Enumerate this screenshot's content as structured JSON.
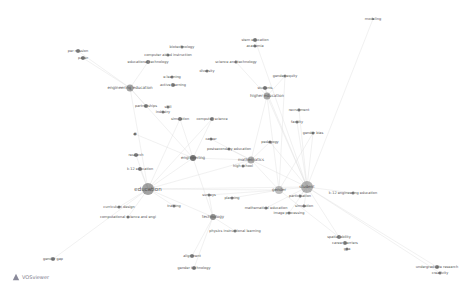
{
  "app": {
    "name": "VOSviewer"
  },
  "network": {
    "nodes": [
      {
        "label": "education",
        "x": 148,
        "y": 189,
        "r": 6,
        "fs": 5.5,
        "color": "#555"
      },
      {
        "label": "student",
        "x": 307,
        "y": 187,
        "r": 6,
        "fs": 4,
        "color": "#777"
      },
      {
        "label": "gender",
        "x": 279,
        "y": 190,
        "r": 4,
        "fs": 4,
        "color": "#888"
      },
      {
        "label": "engineering education",
        "x": 130,
        "y": 88,
        "r": 3.5,
        "fs": 4,
        "color": "#555"
      },
      {
        "label": "higher education",
        "x": 267,
        "y": 96,
        "r": 3.5,
        "fs": 4,
        "color": "#666"
      },
      {
        "label": "mathematics",
        "x": 251,
        "y": 160,
        "r": 3.5,
        "fs": 4,
        "color": "#666"
      },
      {
        "label": "engineering",
        "x": 193,
        "y": 158,
        "r": 3,
        "fs": 4,
        "color": "#555"
      },
      {
        "label": "technology",
        "x": 213,
        "y": 217,
        "r": 3,
        "fs": 4,
        "color": "#777"
      },
      {
        "label": "students",
        "x": 265,
        "y": 88,
        "r": 2,
        "fs": 3.5,
        "color": "#666"
      },
      {
        "label": "stem education",
        "x": 255,
        "y": 40,
        "r": 2,
        "fs": 3.5,
        "color": "#666"
      },
      {
        "label": "academia",
        "x": 255,
        "y": 46,
        "r": 1.5,
        "fs": 3.5,
        "color": "#666"
      },
      {
        "label": "science and technology",
        "x": 236,
        "y": 62,
        "r": 1.5,
        "fs": 3.5,
        "color": "#666"
      },
      {
        "label": "gender equity",
        "x": 285,
        "y": 76,
        "r": 1.5,
        "fs": 3.5,
        "color": "#666"
      },
      {
        "label": "recruitment",
        "x": 299,
        "y": 110,
        "r": 1.5,
        "fs": 3.5,
        "color": "#666"
      },
      {
        "label": "faculty",
        "x": 297,
        "y": 122,
        "r": 1.5,
        "fs": 3.5,
        "color": "#666"
      },
      {
        "label": "gender bias",
        "x": 313,
        "y": 133,
        "r": 1.5,
        "fs": 3.5,
        "color": "#666"
      },
      {
        "label": "pedagogy",
        "x": 270,
        "y": 142,
        "r": 1.5,
        "fs": 3.5,
        "color": "#666"
      },
      {
        "label": "postsecondary education",
        "x": 229,
        "y": 149,
        "r": 1.5,
        "fs": 3.5,
        "color": "#666"
      },
      {
        "label": "high school",
        "x": 243,
        "y": 166,
        "r": 1.5,
        "fs": 3.5,
        "color": "#666"
      },
      {
        "label": "career",
        "x": 211,
        "y": 139,
        "r": 1.5,
        "fs": 3.5,
        "color": "#666"
      },
      {
        "label": "computer science",
        "x": 212,
        "y": 119,
        "r": 2,
        "fs": 3.5,
        "color": "#666"
      },
      {
        "label": "simulation",
        "x": 180,
        "y": 119,
        "r": 2,
        "fs": 3.5,
        "color": "#666"
      },
      {
        "label": "partnerships",
        "x": 146,
        "y": 106,
        "r": 2,
        "fs": 3.5,
        "color": "#666"
      },
      {
        "label": "skill",
        "x": 168,
        "y": 107,
        "r": 1.5,
        "fs": 3.5,
        "color": "#666"
      },
      {
        "label": "industry",
        "x": 163,
        "y": 112,
        "r": 1.5,
        "fs": 3.5,
        "color": "#666"
      },
      {
        "label": "diversity",
        "x": 207,
        "y": 71,
        "r": 1.5,
        "fs": 3.5,
        "color": "#666"
      },
      {
        "label": "biotechnology",
        "x": 182,
        "y": 47,
        "r": 1.5,
        "fs": 3.5,
        "color": "#666"
      },
      {
        "label": "computer aided instruction",
        "x": 168,
        "y": 55,
        "r": 1.5,
        "fs": 3.5,
        "color": "#666"
      },
      {
        "label": "educational technology",
        "x": 148,
        "y": 62,
        "r": 2,
        "fs": 3.5,
        "color": "#666"
      },
      {
        "label": "e-learning",
        "x": 172,
        "y": 77,
        "r": 1.5,
        "fs": 3.5,
        "color": "#666"
      },
      {
        "label": "active learning",
        "x": 173,
        "y": 85,
        "r": 2,
        "fs": 3.5,
        "color": "#666"
      },
      {
        "label": "per mission",
        "x": 78,
        "y": 51,
        "r": 2,
        "fs": 3.5,
        "color": "#666"
      },
      {
        "label": "paper",
        "x": 83,
        "y": 58,
        "r": 2,
        "fs": 3.5,
        "color": "#666"
      },
      {
        "label": "ai",
        "x": 135,
        "y": 134,
        "r": 1.5,
        "fs": 3.5,
        "color": "#666"
      },
      {
        "label": "research",
        "x": 136,
        "y": 155,
        "r": 2,
        "fs": 3.5,
        "color": "#666"
      },
      {
        "label": "k-12 education",
        "x": 140,
        "y": 169,
        "r": 2,
        "fs": 3.5,
        "color": "#666"
      },
      {
        "label": "curriculum design",
        "x": 119,
        "y": 207,
        "r": 1.5,
        "fs": 3.5,
        "color": "#666"
      },
      {
        "label": "computational science and engi",
        "x": 128,
        "y": 217,
        "r": 1.5,
        "fs": 3.5,
        "color": "#666"
      },
      {
        "label": "training",
        "x": 174,
        "y": 206,
        "r": 1.5,
        "fs": 3.5,
        "color": "#666"
      },
      {
        "label": "surveys",
        "x": 209,
        "y": 195,
        "r": 1.5,
        "fs": 3.5,
        "color": "#666"
      },
      {
        "label": "planning",
        "x": 232,
        "y": 198,
        "r": 1.5,
        "fs": 3.5,
        "color": "#666"
      },
      {
        "label": "mathematical education",
        "x": 266,
        "y": 208,
        "r": 1.5,
        "fs": 3.5,
        "color": "#666"
      },
      {
        "label": "image processing",
        "x": 289,
        "y": 213,
        "r": 1.5,
        "fs": 3.5,
        "color": "#666"
      },
      {
        "label": "simulation",
        "x": 304,
        "y": 206,
        "r": 1.5,
        "fs": 3.5,
        "color": "#666"
      },
      {
        "label": "participation",
        "x": 300,
        "y": 196,
        "r": 1.5,
        "fs": 3.5,
        "color": "#666"
      },
      {
        "label": "k-12 engineering education",
        "x": 353,
        "y": 193,
        "r": 1.5,
        "fs": 3.5,
        "color": "#666"
      },
      {
        "label": "physics instructional learning",
        "x": 235,
        "y": 231,
        "r": 1.5,
        "fs": 3.5,
        "color": "#666"
      },
      {
        "label": "alignment",
        "x": 192,
        "y": 256,
        "r": 2,
        "fs": 3.5,
        "color": "#666"
      },
      {
        "label": "gender technology",
        "x": 194,
        "y": 268,
        "r": 2,
        "fs": 3.5,
        "color": "#666"
      },
      {
        "label": "spatial ability",
        "x": 339,
        "y": 237,
        "r": 2,
        "fs": 3.5,
        "color": "#666"
      },
      {
        "label": "career barriers",
        "x": 345,
        "y": 243,
        "r": 2,
        "fs": 3.5,
        "color": "#666"
      },
      {
        "label": "gpa",
        "x": 347,
        "y": 249,
        "r": 1.5,
        "fs": 3.5,
        "color": "#666"
      },
      {
        "label": "gender gap",
        "x": 53,
        "y": 259,
        "r": 2,
        "fs": 3.5,
        "color": "#666"
      },
      {
        "label": "modeling",
        "x": 373,
        "y": 19,
        "r": 1,
        "fs": 3.5,
        "color": "#777"
      },
      {
        "label": "undergraduate research",
        "x": 437,
        "y": 267,
        "r": 2,
        "fs": 3.5,
        "color": "#666"
      },
      {
        "label": "creativity",
        "x": 440,
        "y": 273,
        "r": 1.5,
        "fs": 3.5,
        "color": "#666"
      }
    ],
    "edges": [
      [
        0,
        1
      ],
      [
        0,
        2
      ],
      [
        0,
        3
      ],
      [
        0,
        6
      ],
      [
        0,
        7
      ],
      [
        0,
        5
      ],
      [
        0,
        34
      ],
      [
        0,
        35
      ],
      [
        0,
        36
      ],
      [
        0,
        37
      ],
      [
        0,
        38
      ],
      [
        0,
        21
      ],
      [
        0,
        52
      ],
      [
        1,
        2
      ],
      [
        1,
        4
      ],
      [
        1,
        5
      ],
      [
        1,
        13
      ],
      [
        1,
        14
      ],
      [
        1,
        15
      ],
      [
        1,
        16
      ],
      [
        1,
        45
      ],
      [
        1,
        49
      ],
      [
        1,
        41
      ],
      [
        1,
        42
      ],
      [
        1,
        43
      ],
      [
        1,
        44
      ],
      [
        1,
        53
      ],
      [
        1,
        8
      ],
      [
        1,
        9
      ],
      [
        2,
        5
      ],
      [
        2,
        4
      ],
      [
        2,
        15
      ],
      [
        2,
        12
      ],
      [
        2,
        49
      ],
      [
        2,
        39
      ],
      [
        2,
        40
      ],
      [
        3,
        31
      ],
      [
        3,
        32
      ],
      [
        3,
        22
      ],
      [
        3,
        28
      ],
      [
        3,
        6
      ],
      [
        4,
        8
      ],
      [
        4,
        12
      ],
      [
        4,
        11
      ],
      [
        4,
        5
      ],
      [
        5,
        16
      ],
      [
        5,
        17
      ],
      [
        5,
        18
      ],
      [
        5,
        6
      ],
      [
        5,
        19
      ],
      [
        6,
        20
      ],
      [
        6,
        21
      ],
      [
        6,
        7
      ],
      [
        7,
        46
      ],
      [
        7,
        47
      ],
      [
        7,
        48
      ],
      [
        7,
        39
      ],
      [
        1,
        54
      ],
      [
        1,
        55
      ],
      [
        0,
        20
      ],
      [
        6,
        33
      ]
    ]
  }
}
